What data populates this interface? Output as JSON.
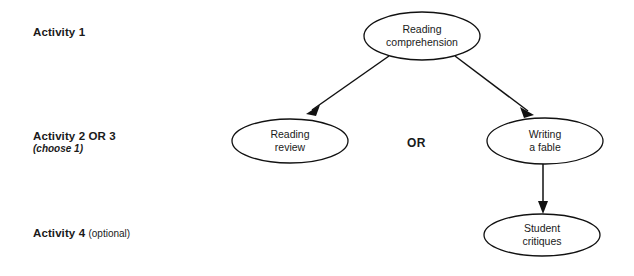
{
  "diagram": {
    "background_color": "#ffffff",
    "line_color": "#111111",
    "text_color": "#1a1a1a",
    "row_labels": [
      {
        "id": "activity-1",
        "main": "Activity 1",
        "sub": "",
        "sub_style": "none"
      },
      {
        "id": "activity-2-or-3",
        "main": "Activity 2 OR 3",
        "sub": "(choose 1)",
        "sub_style": "italic-block"
      },
      {
        "id": "activity-4",
        "main": "Activity 4",
        "sub": "(optional)",
        "sub_style": "plain-inline"
      }
    ],
    "nodes": [
      {
        "id": "reading-comprehension",
        "line1": "Reading",
        "line2": "comprehension",
        "cx": 422,
        "cy": 36,
        "rx": 58,
        "ry": 24
      },
      {
        "id": "reading-review",
        "line1": "Reading",
        "line2": "review",
        "cx": 290,
        "cy": 141,
        "rx": 58,
        "ry": 22
      },
      {
        "id": "writing-a-fable",
        "line1": "Writing",
        "line2": "a fable",
        "cx": 545,
        "cy": 141,
        "rx": 58,
        "ry": 23
      },
      {
        "id": "student-critiques",
        "line1": "Student",
        "line2": "critiques",
        "cx": 542,
        "cy": 235,
        "rx": 58,
        "ry": 21
      }
    ],
    "connector_label": "OR",
    "edges": [
      {
        "id": "comprehension-to-review",
        "from": "reading-comprehension",
        "to": "reading-review",
        "style": "arrow"
      },
      {
        "id": "comprehension-to-fable",
        "from": "reading-comprehension",
        "to": "writing-a-fable",
        "style": "arrow"
      },
      {
        "id": "fable-to-critiques",
        "from": "writing-a-fable",
        "to": "student-critiques",
        "style": "arrow"
      }
    ]
  }
}
